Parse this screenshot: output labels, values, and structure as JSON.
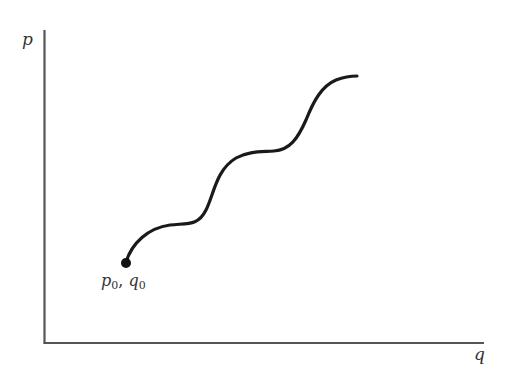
{
  "diagram": {
    "axes": {
      "y_label": "p",
      "x_label": "q"
    },
    "start_point": {
      "var1": "p",
      "sub1": "0",
      "separator": ",",
      "var2": "q",
      "sub2": "0"
    },
    "colors": {
      "axis": "#555555",
      "curve": "#1a1a1a",
      "text": "#333333"
    }
  }
}
